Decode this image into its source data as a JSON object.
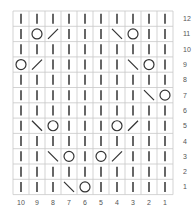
{
  "chart": {
    "type": "knitting-chart",
    "columns": 10,
    "rows": 12,
    "column_labels": [
      "10",
      "9",
      "8",
      "7",
      "6",
      "5",
      "4",
      "3",
      "2",
      "1"
    ],
    "row_labels": [
      "12",
      "11",
      "10",
      "9",
      "8",
      "7",
      "6",
      "5",
      "4",
      "3",
      "2",
      "1"
    ],
    "legend_symbols": {
      "|": "knit",
      "O": "yarn-over",
      "/": "k2tog",
      "\\": "ssk"
    },
    "grid_rows_top_to_bottom": [
      [
        "|",
        "|",
        "|",
        "|",
        "|",
        "|",
        "|",
        "|",
        "|",
        "|"
      ],
      [
        "|",
        "O",
        "/",
        "|",
        "|",
        "|",
        "\\",
        "O",
        "|",
        "|"
      ],
      [
        "|",
        "|",
        "|",
        "|",
        "|",
        "|",
        "|",
        "|",
        "|",
        "|"
      ],
      [
        "O",
        "/",
        "|",
        "|",
        "|",
        "|",
        "|",
        "\\",
        "O",
        "|"
      ],
      [
        "|",
        "|",
        "|",
        "|",
        "|",
        "|",
        "|",
        "|",
        "|",
        "|"
      ],
      [
        "|",
        "|",
        "|",
        "|",
        "|",
        "|",
        "|",
        "|",
        "\\",
        "O"
      ],
      [
        "|",
        "|",
        "|",
        "|",
        "|",
        "|",
        "|",
        "|",
        "|",
        "|"
      ],
      [
        "|",
        "\\",
        "O",
        "|",
        "|",
        "|",
        "O",
        "/",
        "|",
        "|"
      ],
      [
        "|",
        "|",
        "|",
        "|",
        "|",
        "|",
        "|",
        "|",
        "|",
        "|"
      ],
      [
        "|",
        "|",
        "\\",
        "O",
        "|",
        "O",
        "/",
        "|",
        "|",
        "|"
      ],
      [
        "|",
        "|",
        "|",
        "|",
        "|",
        "|",
        "|",
        "|",
        "|",
        "|"
      ],
      [
        "|",
        "|",
        "|",
        "\\",
        "O",
        "|",
        "|",
        "|",
        "|",
        "|"
      ]
    ],
    "colors": {
      "grid": "#c8c8c8",
      "symbol": "#333333",
      "label": "#555555"
    }
  }
}
